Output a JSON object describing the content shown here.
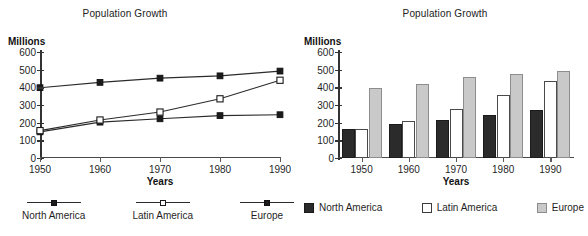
{
  "chart_data": [
    {
      "type": "line",
      "title": "Population Growth",
      "xlabel": "Years",
      "ylabel": "Millions",
      "categories": [
        "1950",
        "1960",
        "1970",
        "1980",
        "1990"
      ],
      "yticks": [
        0,
        100,
        200,
        300,
        400,
        500,
        600
      ],
      "ylim": [
        0,
        600
      ],
      "grid": false,
      "legend_position": "bottom",
      "series": [
        {
          "name": "North America",
          "marker": "filled-square",
          "values": [
            148,
            203,
            222,
            240,
            245
          ]
        },
        {
          "name": "Latin America",
          "marker": "open-square",
          "values": [
            155,
            215,
            260,
            335,
            440
          ]
        },
        {
          "name": "Europe",
          "marker": "filled-square",
          "values": [
            398,
            428,
            452,
            465,
            492
          ]
        }
      ]
    },
    {
      "type": "bar",
      "title": "Population Growth",
      "xlabel": "Years",
      "ylabel": "Millions",
      "categories": [
        "1950",
        "1960",
        "1970",
        "1980",
        "1990"
      ],
      "yticks": [
        0,
        100,
        200,
        300,
        400,
        500,
        600
      ],
      "ylim": [
        0,
        600
      ],
      "grid": false,
      "legend_position": "bottom",
      "series": [
        {
          "name": "North America",
          "color": "#2b2b2b",
          "values": [
            165,
            195,
            215,
            243,
            273
          ]
        },
        {
          "name": "Latin America",
          "color": "#ffffff",
          "values": [
            165,
            212,
            280,
            358,
            437
          ]
        },
        {
          "name": "Europe",
          "color": "#c9c9c9",
          "values": [
            395,
            420,
            458,
            477,
            490
          ]
        }
      ]
    }
  ],
  "line_chart": {
    "title": "Population Growth",
    "y_unit": "Millions",
    "x_title": "Years",
    "yticks": [
      "600",
      "500",
      "400",
      "300",
      "200",
      "100",
      "0"
    ],
    "xticks": [
      "1950",
      "1960",
      "1970",
      "1980",
      "1990"
    ],
    "legend": [
      {
        "label": "North America",
        "marker": "filled-square"
      },
      {
        "label": "Latin America",
        "marker": "open-square"
      },
      {
        "label": "Europe",
        "marker": "filled-square"
      }
    ]
  },
  "bar_chart": {
    "title": "Population Growth",
    "y_unit": "Millions",
    "x_title": "Years",
    "yticks": [
      "600",
      "500",
      "400",
      "300",
      "200",
      "100",
      "0"
    ],
    "xticks": [
      "1950",
      "1960",
      "1970",
      "1980",
      "1990"
    ],
    "legend": [
      {
        "label": "North America",
        "swatch": "dark"
      },
      {
        "label": "Latin America",
        "swatch": "white"
      },
      {
        "label": "Europe",
        "swatch": "gray"
      }
    ]
  }
}
